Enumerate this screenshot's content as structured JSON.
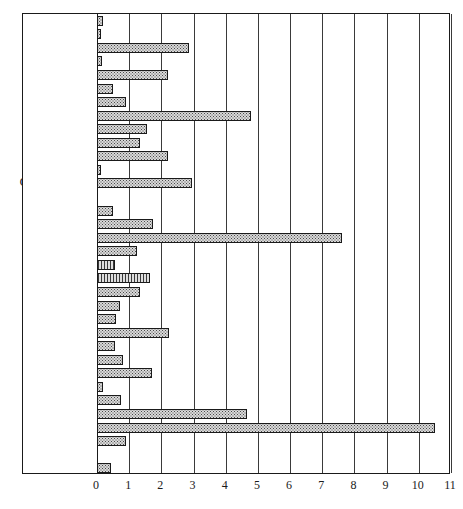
{
  "chart_data": {
    "type": "bar",
    "orientation": "horizontal",
    "title": "",
    "subtitle": "",
    "xlabel": "",
    "ylabel": "",
    "xlim": [
      0,
      11
    ],
    "xticks": [
      0,
      1,
      2,
      3,
      4,
      5,
      6,
      7,
      8,
      9,
      10,
      11
    ],
    "xtick_labels": [
      "0",
      "1",
      "2",
      "3",
      "4",
      "5",
      "6",
      "7",
      "8",
      "9",
      "10",
      "11"
    ],
    "grid": "vertical",
    "legend": "none",
    "annotations": [],
    "categories": [
      "Algeria",
      "Argentina",
      "Australia",
      "Austria",
      "Belgium",
      "Brazil",
      "Bulgaria",
      "Canada",
      "China",
      "Finland",
      "France",
      "Germany, East",
      "Germany, West",
      "Hungary",
      "India",
      "Italy",
      "Japan",
      "Korea, North",
      "Korea, South",
      "Mexico",
      "Netherlands",
      "Norway",
      "Peru",
      "Poland",
      "Romania",
      "South Africa",
      "Spain",
      "Turkey",
      "UK",
      "USA",
      "USSR",
      "Yugoslavia",
      "Zaire",
      "Zambia"
    ],
    "values": [
      0.2,
      0.13,
      2.85,
      0.15,
      2.2,
      0.5,
      0.9,
      4.8,
      1.55,
      1.35,
      2.2,
      0.12,
      2.95,
      0.0,
      0.5,
      1.75,
      7.6,
      1.25,
      0.55,
      1.65,
      1.35,
      0.7,
      0.6,
      2.25,
      0.55,
      0.8,
      1.7,
      0.2,
      0.75,
      4.65,
      10.5,
      0.9,
      0.0,
      0.45
    ],
    "bar_styles": [
      "dotted",
      "dotted",
      "dotted",
      "dotted",
      "dotted",
      "dotted",
      "dotted",
      "dotted",
      "dotted",
      "dotted",
      "dotted",
      "dotted",
      "dotted",
      "dotted",
      "dotted",
      "dotted",
      "dotted",
      "dotted",
      "hatch-vertical",
      "hatch-vertical",
      "dotted",
      "dotted",
      "dotted",
      "dotted",
      "dotted",
      "dotted",
      "dotted",
      "dotted",
      "dotted",
      "dotted",
      "dotted",
      "dotted",
      "dotted",
      "dotted"
    ]
  },
  "style": {
    "bar_fill": "#d9d9d9",
    "bar_dot": "#4a4a4a",
    "bar_border": "#1a1a1a",
    "frame_color": "#1a1a1a",
    "grid_color": "#3a3a3a",
    "background": "#ffffff",
    "text_color": "#1a1a1a"
  }
}
